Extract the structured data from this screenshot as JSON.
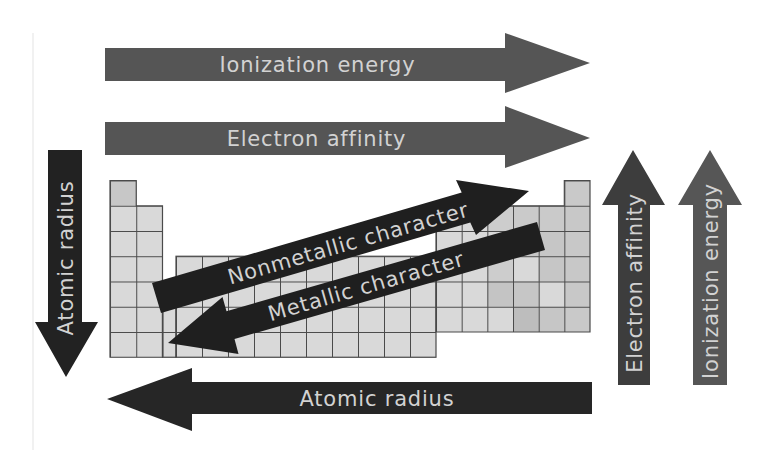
{
  "colors": {
    "background": "#ffffff",
    "label_text": "#d2d2d2",
    "cell_fill": "#d9d9d9",
    "grid_line": "#4a4a4a",
    "edge_line": "#ececec"
  },
  "arrows": {
    "ionization_energy_top": {
      "label": "Ionization energy",
      "direction": "right",
      "color": "#555555"
    },
    "electron_affinity_top": {
      "label": "Electron affinity",
      "direction": "right",
      "color": "#555555"
    },
    "atomic_radius_left": {
      "label": "Atomic radius",
      "direction": "down",
      "color": "#222222"
    },
    "nonmetallic_character": {
      "label": "Nonmetallic character",
      "direction": "up-right",
      "color": "#1f1f1f"
    },
    "metallic_character": {
      "label": "Metallic character",
      "direction": "down-left",
      "color": "#1f1f1f"
    },
    "electron_affinity_right": {
      "label": "Electron affinity",
      "direction": "up",
      "color": "#3d3d3d"
    },
    "ionization_energy_right": {
      "label": "Ionization energy",
      "direction": "up",
      "color": "#565656"
    },
    "atomic_radius_bottom": {
      "label": "Atomic radius",
      "direction": "left",
      "color": "#262626"
    }
  },
  "periodic_table": {
    "rows": 7,
    "columns": 18
  }
}
